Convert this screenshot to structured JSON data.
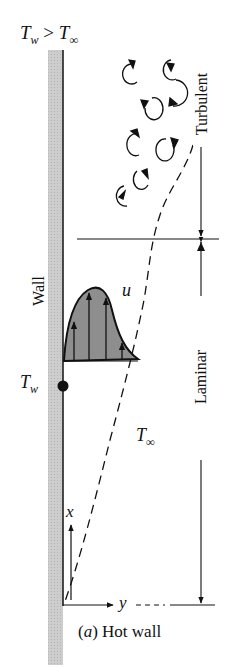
{
  "figure": {
    "condition_label": {
      "T": "T",
      "w": "w",
      "gt": " > ",
      "T2": "T",
      "inf": "∞"
    },
    "wall_label": "Wall",
    "wall_temp_label": {
      "T": "T",
      "sub": "w"
    },
    "velocity_label": "u",
    "ambient_temp_label": {
      "T": "T",
      "sub": "∞"
    },
    "axis_x_label": "x",
    "axis_y_label": "y",
    "region_turbulent": "Turbulent",
    "region_laminar": "Laminar",
    "caption": "(a) Hot wall",
    "caption_parts": {
      "open": "(",
      "letter": "a",
      "close": ")",
      "text": " Hot wall"
    },
    "colors": {
      "wall_fill": "#c8c8c8",
      "profile_fill": "#8a8a8a",
      "ink": "#111111",
      "background": "#ffffff"
    }
  }
}
